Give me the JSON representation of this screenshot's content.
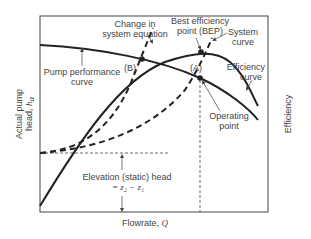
{
  "diagram": {
    "axes": {
      "y_left_label": "Actual pump head, ",
      "y_left_symbol": "h",
      "y_left_subscript": "a",
      "y_right_label": "Efficiency",
      "x_label": "Flowrate, ",
      "x_symbol": "Q"
    },
    "annotations": {
      "change_line1": "Change in",
      "change_line2": "system equation",
      "bep_line1": "Best efficiency",
      "bep_line2": "point (BEP)",
      "system_line1": "System",
      "system_line2": "curve",
      "efficiency_line1": "Efficiency",
      "efficiency_line2": "curve",
      "pump_line1": "Pump performance",
      "pump_line2": "curve",
      "point_b": "(B)",
      "point_a": "(A)",
      "operating_line1": "Operating",
      "operating_line2": "point",
      "elevation_line1": "Elevation (static) head",
      "elevation_line2": "= z₂ − z₁"
    },
    "colors": {
      "curve": "#222222",
      "frame": "#444444",
      "text": "#444444"
    }
  }
}
